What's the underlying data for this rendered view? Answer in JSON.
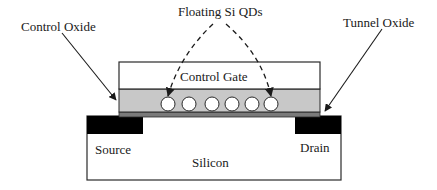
{
  "diagram": {
    "type": "device cross-section",
    "labels": {
      "floating_qds": "Floating Si QDs",
      "control_oxide": "Control Oxide",
      "tunnel_oxide": "Tunnel Oxide",
      "control_gate": "Control Gate",
      "source": "Source",
      "drain": "Drain",
      "silicon": "Silicon"
    },
    "layers": [
      {
        "name": "Control Gate",
        "color": "#ffffff"
      },
      {
        "name": "Control Oxide",
        "color": "#c8c8c8"
      },
      {
        "name": "Tunnel Oxide",
        "color": "#7a7a7a"
      },
      {
        "name": "Silicon",
        "color": "#ffffff"
      }
    ],
    "regions": [
      {
        "name": "Source",
        "color": "#000000"
      },
      {
        "name": "Drain",
        "color": "#000000"
      }
    ],
    "quantum_dot_count": 6,
    "colors": {
      "outline": "#2a2a2a",
      "oxide_fill": "#c8c8c8",
      "tunnel_fill": "#7a7a7a",
      "contact_fill": "#000000"
    }
  }
}
